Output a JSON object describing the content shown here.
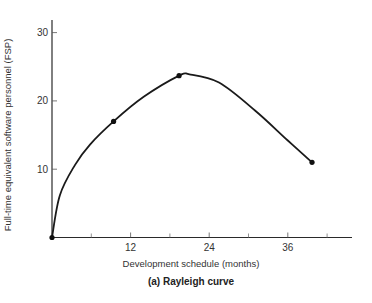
{
  "chart_data": {
    "type": "line",
    "title": "(a) Rayleigh curve",
    "xlabel": "Development schedule (months)",
    "ylabel": "Full-time equivalent software personnel (FSP)",
    "xlim": [
      0,
      46
    ],
    "ylim": [
      0,
      32
    ],
    "x_ticks": [
      12,
      24,
      36
    ],
    "x_minor_ticks": [
      6,
      18,
      30,
      42
    ],
    "y_ticks": [
      10,
      20,
      30
    ],
    "grid": false,
    "legend": null,
    "series": [
      {
        "name": "Rayleigh curve",
        "marked_points": [
          {
            "x": 0,
            "y": 0
          },
          {
            "x": 9.4,
            "y": 17
          },
          {
            "x": 19.4,
            "y": 23.7
          },
          {
            "x": 39.7,
            "y": 11
          }
        ],
        "curve": [
          {
            "x": 0,
            "y": 0
          },
          {
            "x": 1.2,
            "y": 6.2
          },
          {
            "x": 3.5,
            "y": 10.6
          },
          {
            "x": 5.8,
            "y": 13.6
          },
          {
            "x": 9.4,
            "y": 17
          },
          {
            "x": 14,
            "y": 20.6
          },
          {
            "x": 19.4,
            "y": 23.7
          },
          {
            "x": 21,
            "y": 23.9
          },
          {
            "x": 25.5,
            "y": 22.7
          },
          {
            "x": 31,
            "y": 18.6
          },
          {
            "x": 36,
            "y": 14.2
          },
          {
            "x": 39.7,
            "y": 11
          }
        ]
      }
    ]
  }
}
